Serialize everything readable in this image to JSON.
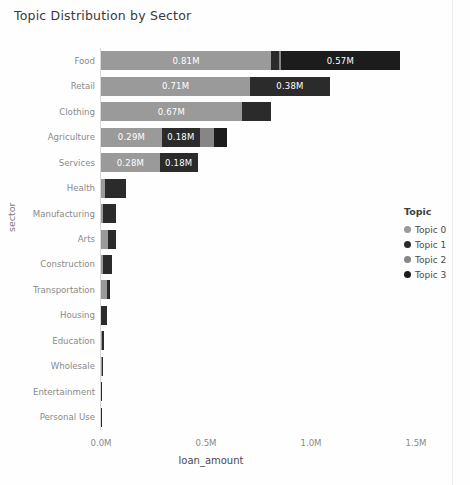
{
  "title": "Topic Distribution by Sector",
  "axes": {
    "ylabel": "sector",
    "xlabel": "loan_amount",
    "xticks": [
      "0.0M",
      "0.5M",
      "1.0M",
      "1.5M"
    ]
  },
  "legend": {
    "title": "Topic",
    "items": [
      {
        "label": "Topic 0",
        "color": "#9a9a9a"
      },
      {
        "label": "Topic 1",
        "color": "#2b2b2b"
      },
      {
        "label": "Topic 2",
        "color": "#868686"
      },
      {
        "label": "Topic 3",
        "color": "#1c1c1c"
      }
    ]
  },
  "chart_data": {
    "type": "bar",
    "orientation": "horizontal",
    "stacked": true,
    "title": "Topic Distribution by Sector",
    "xlabel": "loan_amount",
    "ylabel": "sector",
    "xlim": [
      0,
      1.5
    ],
    "xtick_values": [
      0.0,
      0.5,
      1.0,
      1.5
    ],
    "xtick_labels": [
      "0.0M",
      "0.5M",
      "1.0M",
      "1.5M"
    ],
    "grid": false,
    "legend_position": "right",
    "categories": [
      "Food",
      "Retail",
      "Clothing",
      "Agriculture",
      "Services",
      "Health",
      "Manufacturing",
      "Arts",
      "Construction",
      "Transportation",
      "Housing",
      "Education",
      "Wholesale",
      "Entertainment",
      "Personal Use"
    ],
    "series": [
      {
        "name": "Topic 0",
        "color": "#9a9a9a",
        "values": [
          0.81,
          0.71,
          0.67,
          0.29,
          0.28,
          0.02,
          0.01,
          0.035,
          0.008,
          0.03,
          0.002,
          0.004,
          0.004,
          0.002,
          0.001
        ]
      },
      {
        "name": "Topic 1",
        "color": "#2b2b2b",
        "values": [
          0.04,
          0.38,
          0.14,
          0.18,
          0.18,
          0.1,
          0.06,
          0.035,
          0.045,
          0.012,
          0.025,
          0.01,
          0.006,
          0.002,
          0.001
        ]
      },
      {
        "name": "Topic 2",
        "color": "#868686",
        "values": [
          0.005,
          0.0,
          0.0,
          0.07,
          0.0,
          0.0,
          0.0,
          0.0,
          0.0,
          0.0,
          0.0,
          0.0,
          0.0,
          0.0,
          0.0
        ]
      },
      {
        "name": "Topic 3",
        "color": "#1c1c1c",
        "values": [
          0.57,
          0.0,
          0.0,
          0.06,
          0.0,
          0.0,
          0.0,
          0.0,
          0.0,
          0.0,
          0.0,
          0.0,
          0.0,
          0.0,
          0.0
        ]
      }
    ],
    "bar_labels": [
      {
        "category": "Food",
        "series": "Topic 0",
        "text": "0.81M"
      },
      {
        "category": "Food",
        "series": "Topic 3",
        "text": "0.57M"
      },
      {
        "category": "Retail",
        "series": "Topic 0",
        "text": "0.71M"
      },
      {
        "category": "Retail",
        "series": "Topic 1",
        "text": "0.38M"
      },
      {
        "category": "Clothing",
        "series": "Topic 0",
        "text": "0.67M"
      },
      {
        "category": "Agriculture",
        "series": "Topic 0",
        "text": "0.29M"
      },
      {
        "category": "Agriculture",
        "series": "Topic 1",
        "text": "0.18M"
      },
      {
        "category": "Services",
        "series": "Topic 0",
        "text": "0.28M"
      },
      {
        "category": "Services",
        "series": "Topic 1",
        "text": "0.18M"
      }
    ]
  }
}
